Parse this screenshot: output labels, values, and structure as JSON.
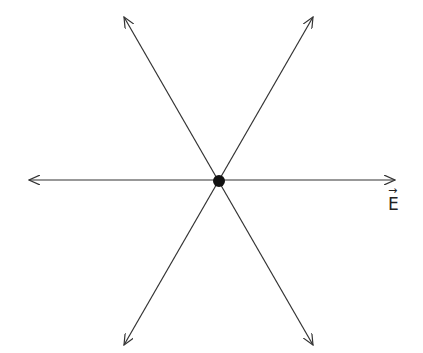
{
  "diagram": {
    "center": {
      "x": 219,
      "y": 181,
      "radius": 6
    },
    "arrows": [
      {
        "name": "horizontal-arrow",
        "x1": 29,
        "y1": 180,
        "x2": 395,
        "y2": 180
      },
      {
        "name": "diagonal-arrow-ascending",
        "x1": 124,
        "y1": 345,
        "x2": 313,
        "y2": 17
      },
      {
        "name": "diagonal-arrow-descending",
        "x1": 124,
        "y1": 17,
        "x2": 313,
        "y2": 345
      }
    ],
    "label": {
      "text": "E",
      "vector_mark": "→",
      "x": 388,
      "y": 194
    },
    "stroke_color": "#333333",
    "dot_color": "#111111"
  }
}
